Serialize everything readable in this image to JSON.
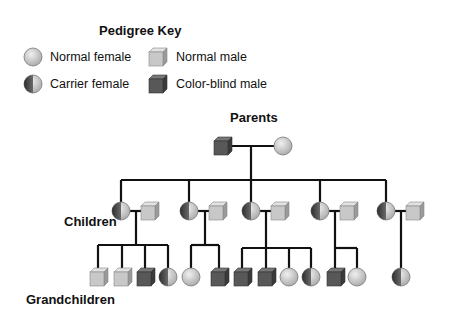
{
  "key": {
    "title": "Pedigree Key",
    "items": [
      {
        "symbol": "normal-female",
        "label": "Normal female"
      },
      {
        "symbol": "normal-male",
        "label": "Normal male"
      },
      {
        "symbol": "carrier-female",
        "label": "Carrier female"
      },
      {
        "symbol": "colorblind-male",
        "label": "Color-blind male"
      }
    ]
  },
  "generations": {
    "parents": "Parents",
    "children": "Children",
    "grandchildren": "Grandchildren"
  },
  "colors": {
    "normal_fill": "#c8c8c8",
    "colorblind_fill": "#585858",
    "carrier_dark": "#4a4a4a",
    "line": "#111111"
  },
  "pedigree": {
    "parents": [
      {
        "type": "colorblind-male"
      },
      {
        "type": "normal-female"
      }
    ],
    "children": [
      {
        "pair": [
          "carrier-female",
          "normal-male"
        ],
        "grandchildren": [
          "normal-male",
          "normal-male",
          "colorblind-male",
          "carrier-female"
        ]
      },
      {
        "pair": [
          "carrier-female",
          "normal-male"
        ],
        "grandchildren": [
          "normal-female",
          "colorblind-male"
        ]
      },
      {
        "pair": [
          "carrier-female",
          "normal-male"
        ],
        "grandchildren": [
          "colorblind-male",
          "colorblind-male",
          "normal-female",
          "carrier-female"
        ]
      },
      {
        "pair": [
          "carrier-female",
          "normal-male"
        ],
        "grandchildren": [
          "colorblind-male",
          "normal-female"
        ]
      },
      {
        "pair": [
          "carrier-female",
          "normal-male"
        ],
        "grandchildren": [
          "carrier-female"
        ]
      }
    ]
  }
}
